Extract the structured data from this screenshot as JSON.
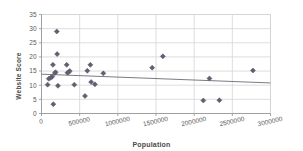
{
  "chart_data": {
    "type": "scatter",
    "title": "",
    "xlabel": "Population",
    "ylabel": "Website Score",
    "xlim": [
      0,
      3000000
    ],
    "ylim": [
      0,
      35
    ],
    "xticks": [
      0,
      500000,
      1000000,
      1500000,
      2000000,
      2500000,
      3000000
    ],
    "xticklabels": [
      "0",
      "500000",
      "1000000",
      "1500000",
      "2000000",
      "2500000",
      "3000000"
    ],
    "yticks": [
      0,
      5,
      10,
      15,
      20,
      25,
      30,
      35
    ],
    "yticklabels": [
      "0",
      "5",
      "10",
      "15",
      "20",
      "25",
      "30",
      "35"
    ],
    "grid": true,
    "legend": false,
    "marker": "diamond",
    "marker_color": "#5f5f70",
    "points": [
      {
        "x": 80000,
        "y": 10.2
      },
      {
        "x": 95000,
        "y": 12.3
      },
      {
        "x": 120000,
        "y": 12.6
      },
      {
        "x": 140000,
        "y": 13.0
      },
      {
        "x": 150000,
        "y": 17.2
      },
      {
        "x": 155000,
        "y": 3.3
      },
      {
        "x": 175000,
        "y": 14.3
      },
      {
        "x": 185000,
        "y": 14.6
      },
      {
        "x": 200000,
        "y": 29.0
      },
      {
        "x": 205000,
        "y": 21.0
      },
      {
        "x": 215000,
        "y": 9.8
      },
      {
        "x": 330000,
        "y": 17.2
      },
      {
        "x": 340000,
        "y": 14.4
      },
      {
        "x": 355000,
        "y": 14.6
      },
      {
        "x": 370000,
        "y": 15.0
      },
      {
        "x": 430000,
        "y": 10.2
      },
      {
        "x": 570000,
        "y": 6.2
      },
      {
        "x": 600000,
        "y": 15.1
      },
      {
        "x": 640000,
        "y": 17.2
      },
      {
        "x": 650000,
        "y": 11.1
      },
      {
        "x": 700000,
        "y": 10.3
      },
      {
        "x": 810000,
        "y": 14.2
      },
      {
        "x": 1450000,
        "y": 16.2
      },
      {
        "x": 1590000,
        "y": 20.2
      },
      {
        "x": 2120000,
        "y": 4.6
      },
      {
        "x": 2200000,
        "y": 12.4
      },
      {
        "x": 2330000,
        "y": 4.7
      },
      {
        "x": 2770000,
        "y": 15.2
      }
    ],
    "trendline": {
      "type": "linear",
      "x_start": 0,
      "y_start": 13.9,
      "x_end": 3000000,
      "y_end": 10.8
    },
    "colors": {
      "marker": "#5f5f70",
      "trendline": "#6b6b78",
      "gridline": "#d4d4d4",
      "axis": "#9a9a9a",
      "text": "#595959",
      "background": "#ffffff"
    }
  }
}
